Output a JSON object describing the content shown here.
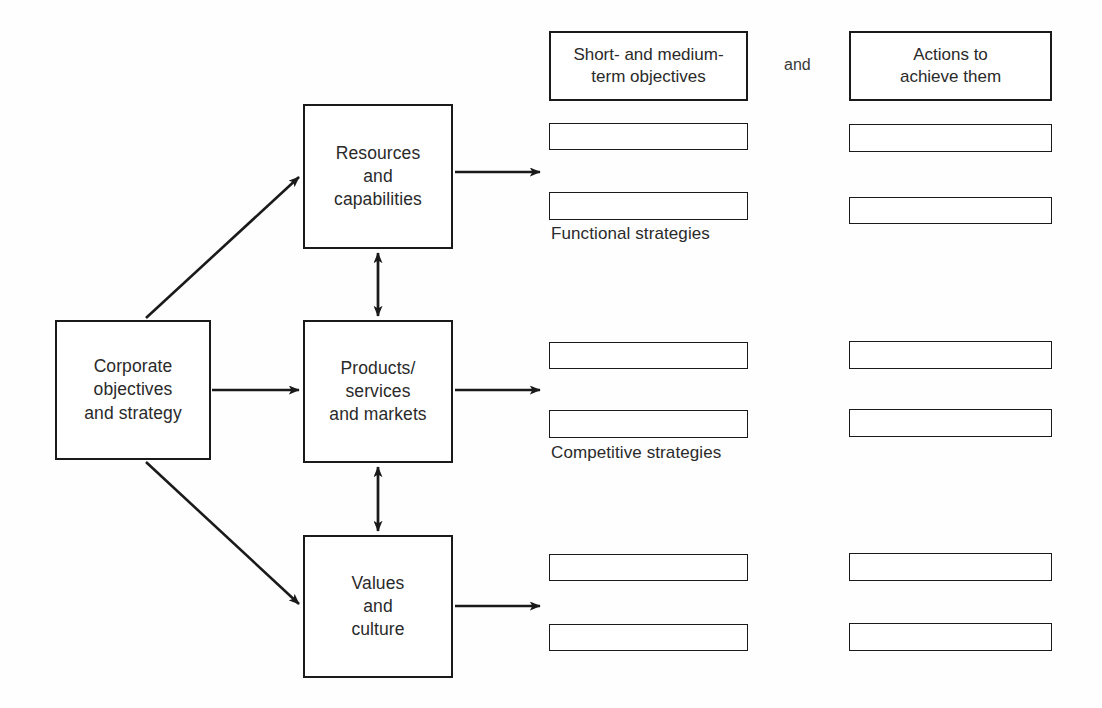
{
  "diagram": {
    "line_color": "#1a1a1a",
    "text_color": "#2a2a2a",
    "background": "#ffffff",
    "conjunction": "and",
    "core_nodes": [
      {
        "id": "corporate",
        "label": "Corporate\nobjectives\nand strategy",
        "x": 55,
        "y": 320,
        "w": 156,
        "h": 140
      },
      {
        "id": "resources",
        "label": "Resources\nand\ncapabilities",
        "x": 303,
        "y": 104,
        "w": 150,
        "h": 145
      },
      {
        "id": "products",
        "label": "Products/\nservices\nand markets",
        "x": 303,
        "y": 320,
        "w": 150,
        "h": 143
      },
      {
        "id": "values",
        "label": "Values\nand\nculture",
        "x": 303,
        "y": 535,
        "w": 150,
        "h": 143
      }
    ],
    "column_headers": [
      {
        "id": "objectives",
        "label": "Short- and medium-\nterm objectives",
        "x": 549,
        "y": 31,
        "w": 199,
        "h": 70
      },
      {
        "id": "actions",
        "label": "Actions to\nachieve them",
        "x": 849,
        "y": 31,
        "w": 203,
        "h": 70
      }
    ],
    "rows": [
      {
        "id": "functional",
        "caption": "Functional strategies",
        "caption_x": 551,
        "caption_y": 224,
        "bars": [
          {
            "col": "objectives",
            "x": 549,
            "y": 123,
            "w": 199,
            "h": 27
          },
          {
            "col": "actions",
            "x": 849,
            "y": 124,
            "w": 203,
            "h": 28
          },
          {
            "col": "objectives",
            "x": 549,
            "y": 192,
            "w": 199,
            "h": 28
          },
          {
            "col": "actions",
            "x": 849,
            "y": 197,
            "w": 203,
            "h": 27
          }
        ]
      },
      {
        "id": "competitive",
        "caption": "Competitive strategies",
        "caption_x": 551,
        "caption_y": 443,
        "bars": [
          {
            "col": "objectives",
            "x": 549,
            "y": 342,
            "w": 199,
            "h": 27
          },
          {
            "col": "actions",
            "x": 849,
            "y": 341,
            "w": 203,
            "h": 28
          },
          {
            "col": "objectives",
            "x": 549,
            "y": 410,
            "w": 199,
            "h": 28
          },
          {
            "col": "actions",
            "x": 849,
            "y": 409,
            "w": 203,
            "h": 28
          }
        ]
      },
      {
        "id": "unlabelled",
        "caption": "",
        "caption_x": 551,
        "caption_y": 672,
        "bars": [
          {
            "col": "objectives",
            "x": 549,
            "y": 554,
            "w": 199,
            "h": 27
          },
          {
            "col": "actions",
            "x": 849,
            "y": 553,
            "w": 203,
            "h": 28
          },
          {
            "col": "objectives",
            "x": 549,
            "y": 624,
            "w": 199,
            "h": 27
          },
          {
            "col": "actions",
            "x": 849,
            "y": 623,
            "w": 203,
            "h": 28
          }
        ]
      }
    ],
    "connectors": [
      {
        "id": "corporate-to-resources",
        "kind": "diagonal-arrow",
        "from": "corporate",
        "to": "resources"
      },
      {
        "id": "corporate-to-products",
        "kind": "horizontal-arrow",
        "from": "corporate",
        "to": "products"
      },
      {
        "id": "corporate-to-values",
        "kind": "diagonal-arrow",
        "from": "corporate",
        "to": "values"
      },
      {
        "id": "resources-products-link",
        "kind": "double-arrow",
        "from": "resources",
        "to": "products"
      },
      {
        "id": "products-values-link",
        "kind": "double-arrow",
        "from": "products",
        "to": "values"
      },
      {
        "id": "resources-to-functional",
        "kind": "horizontal-arrow",
        "from": "resources",
        "to": "functional"
      },
      {
        "id": "products-to-competitive",
        "kind": "horizontal-arrow",
        "from": "products",
        "to": "competitive"
      },
      {
        "id": "values-to-unlabelled",
        "kind": "horizontal-arrow",
        "from": "values",
        "to": "unlabelled"
      }
    ]
  }
}
